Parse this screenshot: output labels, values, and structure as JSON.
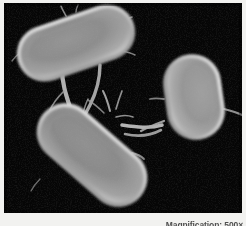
{
  "figure": {
    "name": "scanning-electron-micrograph",
    "background_color": "#f2f2f0",
    "plate_background_color": "#050505"
  },
  "caption": {
    "text": "Magnification: 500×",
    "label": "Magnification",
    "value": "500×"
  },
  "micrograph": {
    "cell_fill_color": "#8a8a8a",
    "cell_rim_color": "#cfcfcf",
    "filament_color": "#b4b4b4",
    "cells": [
      {
        "name": "cell-top-left",
        "shape": "rod",
        "center_x": 72,
        "center_y": 40,
        "length": 122,
        "width": 56,
        "rotation_deg": -19
      },
      {
        "name": "cell-bottom-center",
        "shape": "rod",
        "center_x": 88,
        "center_y": 152,
        "length": 128,
        "width": 58,
        "rotation_deg": 41
      },
      {
        "name": "cell-right",
        "shape": "oval",
        "center_x": 190,
        "center_y": 94,
        "length": 86,
        "width": 58,
        "rotation_deg": 82
      }
    ],
    "filaments": [
      {
        "name": "filament-topleft-to-bottom-a"
      },
      {
        "name": "filament-topleft-to-bottom-b"
      },
      {
        "name": "filament-bottom-to-right-a"
      },
      {
        "name": "filament-bottom-to-right-b"
      },
      {
        "name": "filament-right-trailing"
      },
      {
        "name": "filament-bottom-upper-tuft"
      }
    ]
  }
}
